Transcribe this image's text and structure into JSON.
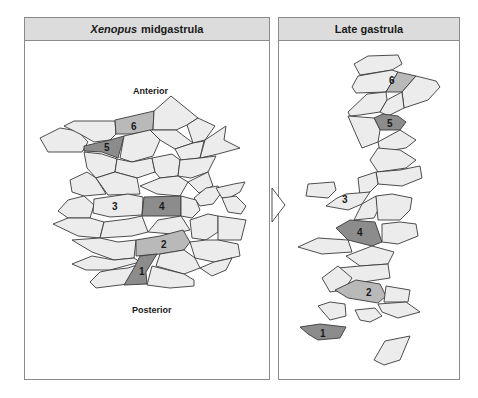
{
  "left_panel": {
    "title_italic": "Xenopus",
    "title_rest": "midgastrula",
    "label_top": "Anterior",
    "label_bottom": "Posterior",
    "numbered_cells": [
      "1",
      "2",
      "3",
      "4",
      "5",
      "6"
    ]
  },
  "right_panel": {
    "title": "Late gastrula",
    "numbered_cells": [
      "1",
      "2",
      "3",
      "4",
      "5",
      "6"
    ]
  },
  "arrow": {
    "direction": "right"
  },
  "colors": {
    "cell_fill": "#ececec",
    "marked_light": "#b9b9b9",
    "marked_dark": "#8c8c8c",
    "outline": "#3a3a3a",
    "header_bg": "#dcdcdc",
    "panel_border": "#8a8a8a"
  },
  "labels": {
    "c1": "1",
    "c2": "2",
    "c3": "3",
    "c4": "4",
    "c5": "5",
    "c6": "6"
  }
}
